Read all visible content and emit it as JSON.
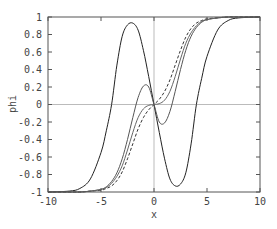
{
  "chart_data": {
    "type": "line",
    "title": "",
    "xlabel": "x",
    "ylabel": "phi",
    "xlim": [
      -10,
      10
    ],
    "ylim": [
      -1,
      1
    ],
    "xticks": [
      -10,
      -5,
      0,
      5,
      10
    ],
    "xtick_labels": [
      "-10",
      "-5",
      "0",
      "5",
      "10"
    ],
    "yticks": [
      -1,
      -0.8,
      -0.6,
      -0.4,
      -0.2,
      0,
      0.2,
      0.4,
      0.6,
      0.8,
      1
    ],
    "ytick_labels": [
      "-1",
      "-0.8",
      "-0.6",
      "-0.4",
      "-0.2",
      "0",
      "0.2",
      "0.4",
      "0.6",
      "0.8",
      "1"
    ],
    "grid": false,
    "zero_lines": true,
    "legend": null,
    "x": [
      -10,
      -8,
      -7,
      -6,
      -5,
      -4.5,
      -4,
      -3.5,
      -3,
      -2.5,
      -2,
      -1.5,
      -1,
      -0.5,
      0,
      0.5,
      1,
      1.5,
      2,
      2.5,
      3,
      3.5,
      4,
      4.5,
      5,
      6,
      7,
      8,
      10
    ],
    "series": [
      {
        "name": "curve-1 (large oscillation)",
        "style": "solid",
        "color": "#222222",
        "values": [
          -1,
          -0.99,
          -0.96,
          -0.85,
          -0.55,
          -0.3,
          0.0,
          0.45,
          0.78,
          0.91,
          0.93,
          0.85,
          0.62,
          0.32,
          0.0,
          -0.32,
          -0.62,
          -0.85,
          -0.93,
          -0.91,
          -0.78,
          -0.45,
          0.0,
          0.3,
          0.55,
          0.85,
          0.96,
          0.99,
          1
        ]
      },
      {
        "name": "curve-2 (small oscillation)",
        "style": "solid",
        "color": "#555555",
        "values": [
          -1,
          -1,
          -1,
          -0.99,
          -0.97,
          -0.94,
          -0.88,
          -0.78,
          -0.62,
          -0.4,
          -0.15,
          0.08,
          0.21,
          0.2,
          0.0,
          -0.2,
          -0.21,
          -0.08,
          0.15,
          0.4,
          0.62,
          0.78,
          0.88,
          0.94,
          0.97,
          0.99,
          1,
          1,
          1
        ]
      },
      {
        "name": "curve-3 (steep monotonic)",
        "style": "dashed",
        "color": "#333333",
        "values": [
          -1,
          -1,
          -1,
          -0.99,
          -0.98,
          -0.96,
          -0.93,
          -0.87,
          -0.77,
          -0.62,
          -0.45,
          -0.28,
          -0.15,
          -0.06,
          0.0,
          0.06,
          0.15,
          0.28,
          0.45,
          0.62,
          0.77,
          0.87,
          0.93,
          0.96,
          0.98,
          0.99,
          1,
          1,
          1
        ]
      },
      {
        "name": "curve-4 (monotonic, flattened near 0)",
        "style": "solid",
        "color": "#666666",
        "values": [
          -1,
          -1,
          -1,
          -0.99,
          -0.97,
          -0.95,
          -0.9,
          -0.82,
          -0.7,
          -0.52,
          -0.32,
          -0.15,
          -0.05,
          -0.01,
          0.0,
          0.01,
          0.05,
          0.15,
          0.32,
          0.52,
          0.7,
          0.82,
          0.9,
          0.95,
          0.97,
          0.99,
          1,
          1,
          1
        ]
      }
    ]
  },
  "plot_area": {
    "left": 48,
    "top": 17,
    "right": 260,
    "bottom": 192
  }
}
